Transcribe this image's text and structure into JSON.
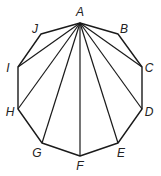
{
  "diagram": {
    "type": "regular-decagon-with-diagonals-from-vertex",
    "stroke_color": "#1a1a1a",
    "vertices": [
      {
        "label": "A",
        "x": 80,
        "y": 23,
        "lx": 80,
        "ly": 16
      },
      {
        "label": "B",
        "x": 118,
        "y": 34,
        "lx": 124,
        "ly": 33
      },
      {
        "label": "C",
        "x": 142,
        "y": 67,
        "lx": 149,
        "ly": 72
      },
      {
        "label": "D",
        "x": 142,
        "y": 109,
        "lx": 149,
        "ly": 116
      },
      {
        "label": "E",
        "x": 118,
        "y": 143,
        "lx": 121,
        "ly": 157
      },
      {
        "label": "F",
        "x": 80,
        "y": 156,
        "lx": 80,
        "ly": 170
      },
      {
        "label": "G",
        "x": 42,
        "y": 143,
        "lx": 37,
        "ly": 157
      },
      {
        "label": "H",
        "x": 18,
        "y": 109,
        "lx": 10,
        "ly": 116
      },
      {
        "label": "I",
        "x": 18,
        "y": 67,
        "lx": 8,
        "ly": 72
      },
      {
        "label": "J",
        "x": 41,
        "y": 34,
        "lx": 35,
        "ly": 33
      }
    ],
    "diagonals_from": "A",
    "diagonals_to": [
      "C",
      "D",
      "E",
      "F",
      "G",
      "H",
      "I"
    ]
  }
}
